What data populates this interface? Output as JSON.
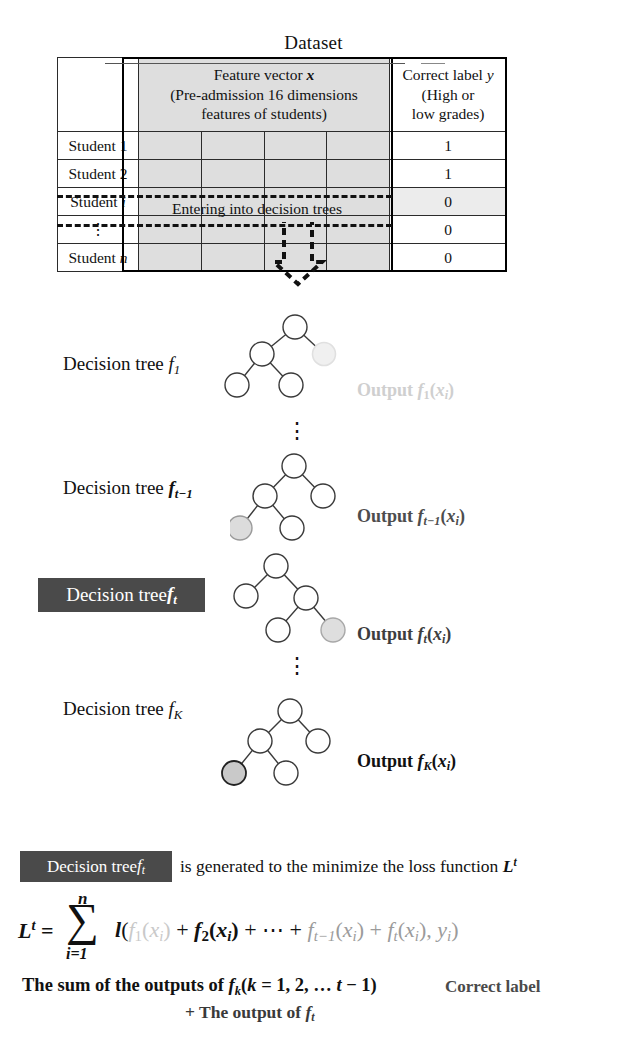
{
  "title": "Dataset",
  "table": {
    "headers": {
      "row_label_col": "",
      "feature_col_line1": "Feature vector x",
      "feature_col_line2": "(Pre-admission 16 dimensions",
      "feature_col_line3": "features of students)",
      "label_col_line1": "Correct label y",
      "label_col_line2": "(High or",
      "label_col_line3": "low grades)"
    },
    "rows": [
      {
        "name": "Student 1",
        "label": "1"
      },
      {
        "name": "Student 2",
        "label": "1"
      },
      {
        "name": "Student i",
        "label": "0"
      },
      {
        "name": "⋮",
        "label": "0"
      },
      {
        "name": "Student n",
        "label": "0"
      }
    ],
    "highlight_note": "Entering into decision trees",
    "highlighted_row_index": 2
  },
  "trees": [
    {
      "label": "Decision tree f₁",
      "output": "Output f₁(xᵢ)",
      "style": "faded",
      "highlighted_node": "right-child"
    },
    {
      "label": "Decision tree fₜ₋₁",
      "output": "Output fₜ₋₁(xᵢ)",
      "style": "dim",
      "highlighted_node": "left-leaf"
    },
    {
      "label": "Decision tree fₜ",
      "output": "Output fₜ(xᵢ)",
      "style": "current",
      "highlighted_node": "right-leaf"
    },
    {
      "label": "Decision tree fₖ",
      "output": "Output fₖ(xᵢ)",
      "style": "dark",
      "highlighted_node": "left-leaf"
    }
  ],
  "ellipsis": "⋮",
  "sentence": {
    "boxed": "Decision tree fₜ",
    "rest": "is generated to the minimize the loss function Lᵗ"
  },
  "formula": {
    "lhs": "Lᵗ =",
    "sum_upper": "n",
    "sum_lower": "i=1",
    "sigma": "∑",
    "term_l": "l(",
    "term_f1": "f₁(xᵢ)",
    "term_plus1": " + ",
    "term_f2": "f₂(xᵢ)",
    "term_plus2": " + ⋯ + ",
    "term_ftm1": "fₜ₋₁(xᵢ)",
    "term_plus3": " + ",
    "term_ft": "fₜ(xᵢ)",
    "term_comma": ", ",
    "term_y": "yᵢ",
    "term_close": ")"
  },
  "caption": {
    "sum_text": "The sum of the outputs of fₖ(k = 1, 2, … t − 1)",
    "plus_text": "+ The output of fₜ",
    "correct_label": "Correct label"
  },
  "colors": {
    "feature_cell_bg": "#dedede",
    "dark_box_bg": "#4a4a4a",
    "node_stroke": "#333333",
    "node_highlight_fill": "#c9c9c9",
    "faded": "#cfcfcf"
  }
}
